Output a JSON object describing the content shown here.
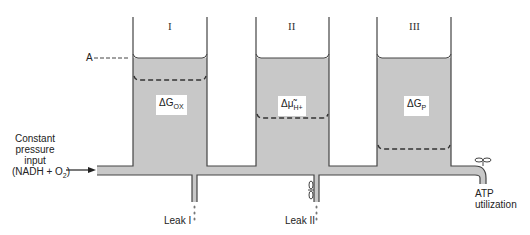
{
  "diagram": {
    "title": "",
    "colors": {
      "fluid": "#c8c8c8",
      "outline": "#444444",
      "background": "#ffffff"
    },
    "input": {
      "line1": "Constant",
      "line2": "pressure",
      "line3": "input",
      "line4_prefix": "(NADH + O",
      "line4_sub": "2",
      "line4_suffix": ")"
    },
    "reference_marker": "A",
    "tanks": [
      {
        "numeral": "I",
        "label_main": "ΔG",
        "label_sub": "OX",
        "fill_level_y": 58,
        "dashed_level_y": 80
      },
      {
        "numeral": "II",
        "label_main": "Δμ̃",
        "label_sub": "H+",
        "fill_level_y": 58,
        "dashed_level_y": 118
      },
      {
        "numeral": "III",
        "label_main": "ΔG",
        "label_sub": "P",
        "fill_level_y": 58,
        "dashed_level_y": 149
      }
    ],
    "leaks": [
      {
        "label": "Leak I"
      },
      {
        "label": "Leak II"
      }
    ],
    "output": {
      "line1": "ATP",
      "line2": "utilization"
    }
  }
}
